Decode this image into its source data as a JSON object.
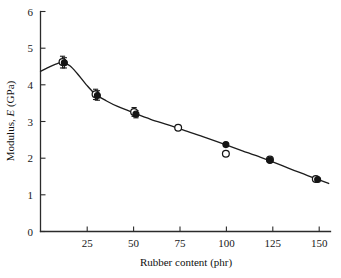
{
  "figure": {
    "background": "#ffffff",
    "axis_color": "#2b2b2b",
    "curve_color": "#1d1d1d",
    "marker_color": "#151515"
  },
  "axes": {
    "x_title_pre": "Rubber content (phr)",
    "x_title": "Rubber content (phr)",
    "y_title_part1": "Modulus, ",
    "y_title_italic": "E",
    "y_title_part2": " (GPa)",
    "y_title": "Modulus, E (GPa)",
    "x_ticks": [
      "25",
      "50",
      "75",
      "100",
      "125",
      "150"
    ],
    "y_ticks": [
      "0",
      "1",
      "2",
      "3",
      "4",
      "5",
      "6"
    ]
  },
  "chart_data": {
    "type": "scatter",
    "title": "",
    "xlabel": "Rubber content (phr)",
    "ylabel": "Modulus, E (GPa)",
    "xlim": [
      0,
      158
    ],
    "ylim": [
      0,
      6
    ],
    "xtick_values": [
      25,
      50,
      75,
      100,
      125,
      150
    ],
    "ytick_values": [
      0,
      1,
      2,
      3,
      4,
      5,
      6
    ],
    "grid": false,
    "legend": "none",
    "series": [
      {
        "name": "open-circle measurements",
        "marker": "open-circle",
        "points": [
          {
            "x": 12,
            "y": 4.62,
            "yerr": 0.16
          },
          {
            "x": 30,
            "y": 3.74,
            "yerr": 0.14
          },
          {
            "x": 51,
            "y": 3.26,
            "yerr": 0.12
          },
          {
            "x": 75,
            "y": 2.83,
            "yerr": 0
          },
          {
            "x": 101,
            "y": 2.12,
            "yerr": 0
          },
          {
            "x": 125,
            "y": 1.96,
            "yerr": 0
          },
          {
            "x": 150,
            "y": 1.43,
            "yerr": 0
          }
        ]
      },
      {
        "name": "filled-circle measurements",
        "marker": "filled-circle",
        "points": [
          {
            "x": 13,
            "y": 4.6,
            "yerr": 0.14
          },
          {
            "x": 31,
            "y": 3.71,
            "yerr": 0.13
          },
          {
            "x": 52,
            "y": 3.2,
            "yerr": 0.1
          },
          {
            "x": 101,
            "y": 2.37,
            "yerr": 0
          },
          {
            "x": 125,
            "y": 1.94,
            "yerr": 0
          },
          {
            "x": 151,
            "y": 1.42,
            "yerr": 0
          }
        ]
      },
      {
        "name": "fitted curve",
        "marker": "none",
        "style": "line",
        "points": [
          {
            "x": 0,
            "y": 4.37
          },
          {
            "x": 4,
            "y": 4.47
          },
          {
            "x": 8,
            "y": 4.56
          },
          {
            "x": 12,
            "y": 4.61
          },
          {
            "x": 16,
            "y": 4.52
          },
          {
            "x": 20,
            "y": 4.31
          },
          {
            "x": 25,
            "y": 4.0
          },
          {
            "x": 30,
            "y": 3.74
          },
          {
            "x": 36,
            "y": 3.56
          },
          {
            "x": 42,
            "y": 3.41
          },
          {
            "x": 51,
            "y": 3.23
          },
          {
            "x": 60,
            "y": 3.06
          },
          {
            "x": 70,
            "y": 2.9
          },
          {
            "x": 80,
            "y": 2.73
          },
          {
            "x": 90,
            "y": 2.56
          },
          {
            "x": 100,
            "y": 2.38
          },
          {
            "x": 110,
            "y": 2.2
          },
          {
            "x": 120,
            "y": 2.02
          },
          {
            "x": 130,
            "y": 1.83
          },
          {
            "x": 140,
            "y": 1.63
          },
          {
            "x": 150,
            "y": 1.44
          },
          {
            "x": 157,
            "y": 1.31
          }
        ]
      }
    ]
  }
}
